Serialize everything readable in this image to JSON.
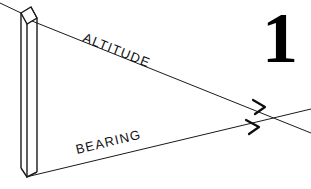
{
  "figure": {
    "number": "1",
    "background_color": "#ffffff",
    "ink_color": "#111111",
    "labels": {
      "altitude": "ALTITUDE",
      "bearing": "BEARING"
    },
    "object": {
      "name": "vertical-prism-column",
      "description": "tall upright triangular prism drawn in line art"
    },
    "rays": [
      {
        "name": "altitude-ray",
        "label": "ALTITUDE",
        "direction": "down-right",
        "has_arrowhead": true
      },
      {
        "name": "bearing-ray",
        "label": "BEARING",
        "direction": "up-right",
        "has_arrowhead": true
      }
    ]
  }
}
